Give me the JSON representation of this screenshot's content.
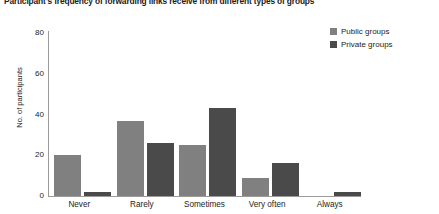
{
  "chart_data": {
    "type": "bar",
    "title": "Participant's frequency of forwarding links receive from different types of groups",
    "xlabel": "",
    "ylabel": "No. of participants",
    "categories": [
      "Never",
      "Rarely",
      "Sometimes",
      "Very often",
      "Always"
    ],
    "series": [
      {
        "name": "Public groups",
        "color": "#808080",
        "values": [
          20,
          37,
          25,
          9,
          0
        ]
      },
      {
        "name": "Private groups",
        "color": "#4a4a4a",
        "values": [
          2,
          26,
          43,
          16,
          2
        ]
      }
    ],
    "ylim": [
      0,
      80
    ],
    "yticks": [
      0,
      20,
      40,
      60,
      80
    ],
    "ytick_labels": [
      "0",
      "20",
      "40",
      "60",
      "80"
    ],
    "grid": false,
    "legend_position": "top-right"
  }
}
